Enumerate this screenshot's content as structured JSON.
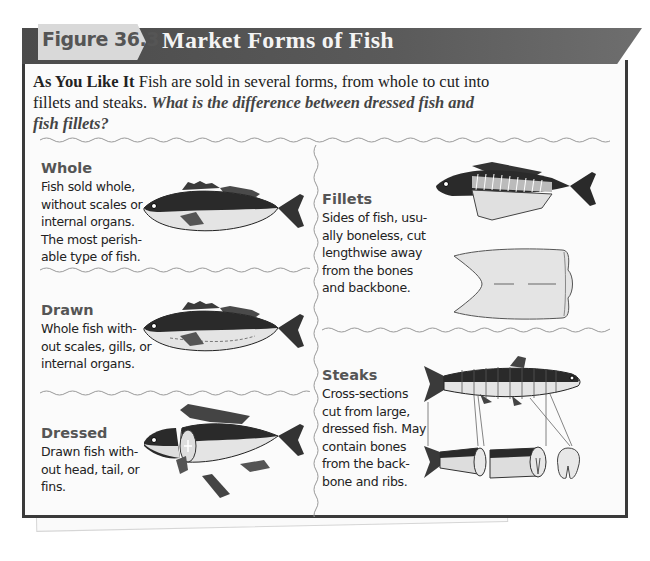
{
  "figure": {
    "number_label": "Figure 36.3",
    "title": "Market Forms of Fish"
  },
  "caption": {
    "lead": "As You Like It",
    "text": "Fish are sold in several forms, from whole to cut into fillets and steaks.",
    "question": "What is the difference between dressed fish and fish fillets?"
  },
  "sections": [
    {
      "id": "whole",
      "title": "Whole",
      "body": [
        "Fish sold whole,",
        "without scales or",
        "internal organs.",
        "The most perish-",
        "able type of fish."
      ]
    },
    {
      "id": "drawn",
      "title": "Drawn",
      "body": [
        "Whole fish with-",
        "out scales, gills, or",
        "internal organs."
      ]
    },
    {
      "id": "dressed",
      "title": "Dressed",
      "body": [
        "Drawn fish with-",
        "out head, tail, or",
        "fins."
      ]
    },
    {
      "id": "fillets",
      "title": "Fillets",
      "body": [
        "Sides of fish, usu-",
        "ally boneless, cut",
        "lengthwise away",
        "from the bones",
        "and backbone."
      ]
    },
    {
      "id": "steaks",
      "title": "Steaks",
      "body": [
        "Cross-sections",
        "cut from large,",
        "dressed fish. May",
        "contain bones",
        "from the back-",
        "bone and ribs."
      ]
    }
  ],
  "colors": {
    "banner": "#4b4b4b",
    "tab": "#d9d9d9",
    "frame": "#3a3a3a",
    "fish_dark": "#2a2a2a",
    "fish_light": "#e4e4e4"
  }
}
